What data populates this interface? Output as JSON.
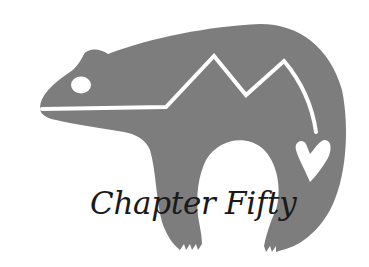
{
  "heading": {
    "title": "Chapter Fifty"
  },
  "illustration": {
    "subject": "bear-heartline-icon",
    "body_color": "#7d7d7d",
    "line_color": "#ffffff",
    "text_color": "#1a1a1a"
  }
}
